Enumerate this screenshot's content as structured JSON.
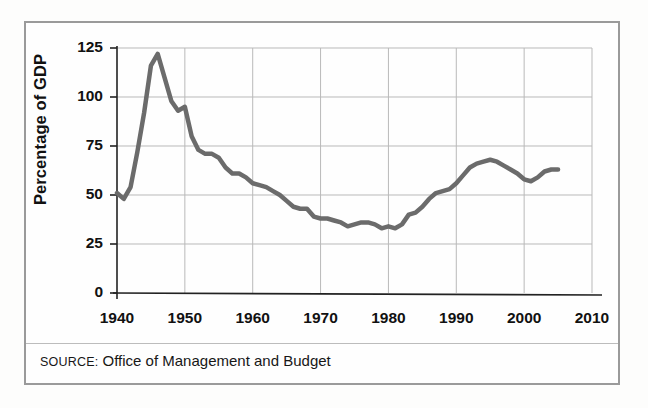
{
  "figure": {
    "source_label": "SOURCE:",
    "source_text": "Office of Management and Budget",
    "frame_color": "#9a9a9a",
    "background_color": "#fefefe"
  },
  "chart_data": {
    "type": "line",
    "title": "",
    "subtitle": "",
    "xlabel": "",
    "ylabel": "Percentage of GDP",
    "xlim": [
      1940,
      2010
    ],
    "ylim": [
      0,
      125
    ],
    "grid": true,
    "legend": "none",
    "line_color": "#6b6b6b",
    "line_width": 4.5,
    "x_ticks": [
      1940,
      1950,
      1960,
      1970,
      1980,
      1990,
      2000,
      2010
    ],
    "x_tick_labels": [
      "1940",
      "1950",
      "1960",
      "1970",
      "1980",
      "1990",
      "2000",
      "2010"
    ],
    "y_ticks": [
      0,
      25,
      50,
      75,
      100,
      125
    ],
    "y_tick_labels": [
      "0",
      "25",
      "50",
      "75",
      "100",
      "125"
    ],
    "series": [
      {
        "name": "Gross federal debt as percentage of GDP",
        "x": [
          1940,
          1941,
          1942,
          1943,
          1944,
          1945,
          1946,
          1947,
          1948,
          1949,
          1950,
          1951,
          1952,
          1953,
          1954,
          1955,
          1956,
          1957,
          1958,
          1959,
          1960,
          1961,
          1962,
          1963,
          1964,
          1965,
          1966,
          1967,
          1968,
          1969,
          1970,
          1971,
          1972,
          1973,
          1974,
          1975,
          1976,
          1977,
          1978,
          1979,
          1980,
          1981,
          1982,
          1983,
          1984,
          1985,
          1986,
          1987,
          1988,
          1989,
          1990,
          1991,
          1992,
          1993,
          1994,
          1995,
          1996,
          1997,
          1998,
          1999,
          2000,
          2001,
          2002,
          2003,
          2004,
          2005
        ],
        "values": [
          51,
          48,
          54,
          72,
          92,
          116,
          122,
          110,
          98,
          93,
          95,
          80,
          73,
          71,
          71,
          69,
          64,
          61,
          61,
          59,
          56,
          55,
          54,
          52,
          50,
          47,
          44,
          43,
          43,
          39,
          38,
          38,
          37,
          36,
          34,
          35,
          36,
          36,
          35,
          33,
          34,
          33,
          35,
          40,
          41,
          44,
          48,
          51,
          52,
          53,
          56,
          60,
          64,
          66,
          67,
          68,
          67,
          65,
          63,
          61,
          58,
          57,
          59,
          62,
          63,
          63
        ],
        "color": "#6b6b6b"
      }
    ],
    "annotations": []
  },
  "axis": {
    "y_title": "Percentage of GDP"
  }
}
